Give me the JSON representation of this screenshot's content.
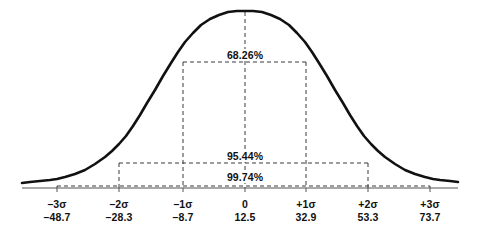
{
  "chart_data": {
    "type": "line",
    "title": "",
    "subtitle": "",
    "xlabel": "",
    "ylabel": "",
    "grid": false,
    "legend": "none",
    "distribution": "normal",
    "mean": 12.5,
    "sigma": 20.4,
    "xlim": [
      -3,
      3
    ],
    "ylim": [
      0,
      1
    ],
    "categories": [
      "-3σ",
      "-2σ",
      "-1σ",
      "0",
      "+1σ",
      "+2σ",
      "+3σ"
    ],
    "values": [
      -48.7,
      -28.3,
      -8.7,
      12.5,
      32.9,
      53.3,
      73.7
    ],
    "ticks": [
      {
        "sigma": "–3σ",
        "value": "–48.7",
        "z": -3,
        "x": 57
      },
      {
        "sigma": "–2σ",
        "value": "–28.3",
        "z": -2,
        "x": 119
      },
      {
        "sigma": "–1σ",
        "value": "–8.7",
        "z": -1,
        "x": 183
      },
      {
        "sigma": "0",
        "value": "12.5",
        "z": 0,
        "x": 245
      },
      {
        "sigma": "+1σ",
        "value": "32.9",
        "z": 1,
        "x": 306
      },
      {
        "sigma": "+2σ",
        "value": "53.3",
        "z": 2,
        "x": 368
      },
      {
        "sigma": "+3σ",
        "value": "73.7",
        "z": 3,
        "x": 430
      }
    ],
    "annotations": [
      {
        "label": "68.26%",
        "z_from": -1,
        "z_to": 1,
        "x_from": 183,
        "x_to": 306,
        "y": 62,
        "text_x": 245,
        "text_y": 55
      },
      {
        "label": "95.44%",
        "z_from": -2,
        "z_to": 2,
        "x_from": 119,
        "x_to": 368,
        "y": 163,
        "text_x": 245,
        "text_y": 156
      },
      {
        "label": "99.74%",
        "z_from": -3,
        "z_to": 3,
        "x_from": 57,
        "x_to": 430,
        "y": 186,
        "text_x": 245,
        "text_y": 177
      }
    ],
    "series": [
      {
        "name": "normal-curve",
        "color": "#111111",
        "points": [
          [
            22,
            183
          ],
          [
            30,
            182
          ],
          [
            40,
            181
          ],
          [
            50,
            180
          ],
          [
            57,
            179
          ],
          [
            65,
            177
          ],
          [
            75,
            174
          ],
          [
            85,
            170
          ],
          [
            95,
            164
          ],
          [
            105,
            157
          ],
          [
            112,
            151
          ],
          [
            119,
            144
          ],
          [
            126,
            136
          ],
          [
            133,
            126
          ],
          [
            140,
            115
          ],
          [
            147,
            103
          ],
          [
            155,
            90
          ],
          [
            163,
            76
          ],
          [
            171,
            63
          ],
          [
            178,
            52
          ],
          [
            185,
            42
          ],
          [
            193,
            33
          ],
          [
            201,
            25
          ],
          [
            210,
            19
          ],
          [
            219,
            15
          ],
          [
            228,
            12
          ],
          [
            237,
            11
          ],
          [
            245,
            11
          ],
          [
            253,
            11
          ],
          [
            262,
            12
          ],
          [
            271,
            15
          ],
          [
            280,
            19
          ],
          [
            289,
            25
          ],
          [
            297,
            33
          ],
          [
            305,
            42
          ],
          [
            312,
            52
          ],
          [
            319,
            63
          ],
          [
            327,
            76
          ],
          [
            335,
            90
          ],
          [
            343,
            103
          ],
          [
            350,
            115
          ],
          [
            357,
            126
          ],
          [
            364,
            136
          ],
          [
            371,
            144
          ],
          [
            378,
            151
          ],
          [
            385,
            157
          ],
          [
            395,
            164
          ],
          [
            405,
            170
          ],
          [
            415,
            174
          ],
          [
            425,
            177
          ],
          [
            433,
            179
          ],
          [
            440,
            180
          ],
          [
            450,
            181
          ],
          [
            458,
            182
          ]
        ]
      }
    ],
    "axis": {
      "y": 188,
      "x_start": 22,
      "x_end": 458,
      "color": "#555555"
    },
    "colors": {
      "curve": "#111111",
      "dashed": "#3a3a3a",
      "text": "#111111",
      "background": "#ffffff"
    }
  }
}
